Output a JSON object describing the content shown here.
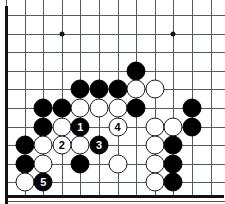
{
  "diagram": {
    "board": {
      "kind": "go-board",
      "visible_columns": 12,
      "visible_rows": 11,
      "cell_size": 18.6,
      "origin_x": 6,
      "origin_y": 15,
      "line_color": "#555a5e",
      "edge_color": "#101214",
      "background_color": "#ffffff",
      "black_color": "#000000",
      "white_color": "#ffffff",
      "edges": [
        "left",
        "bottom"
      ],
      "star_points": [
        {
          "col": 3,
          "row": 1
        },
        {
          "col": 9,
          "row": 1
        }
      ]
    },
    "stones": [
      {
        "col": 7,
        "row": 3,
        "color": "black",
        "label": ""
      },
      {
        "col": 4,
        "row": 4,
        "color": "black",
        "label": ""
      },
      {
        "col": 5,
        "row": 4,
        "color": "black",
        "label": ""
      },
      {
        "col": 6,
        "row": 4,
        "color": "black",
        "label": ""
      },
      {
        "col": 7,
        "row": 4,
        "color": "white",
        "label": ""
      },
      {
        "col": 8,
        "row": 4,
        "color": "white",
        "label": ""
      },
      {
        "col": 2,
        "row": 5,
        "color": "black",
        "label": ""
      },
      {
        "col": 3,
        "row": 5,
        "color": "black",
        "label": ""
      },
      {
        "col": 4,
        "row": 5,
        "color": "white",
        "label": ""
      },
      {
        "col": 5,
        "row": 5,
        "color": "white",
        "label": ""
      },
      {
        "col": 6,
        "row": 5,
        "color": "white",
        "label": ""
      },
      {
        "col": 7,
        "row": 5,
        "color": "black",
        "label": ""
      },
      {
        "col": 10,
        "row": 5,
        "color": "black",
        "label": ""
      },
      {
        "col": 2,
        "row": 6,
        "color": "black",
        "label": ""
      },
      {
        "col": 3,
        "row": 6,
        "color": "white",
        "label": ""
      },
      {
        "col": 4,
        "row": 6,
        "color": "black",
        "label": "1"
      },
      {
        "col": 6,
        "row": 6,
        "color": "white",
        "label": "4"
      },
      {
        "col": 8,
        "row": 6,
        "color": "white",
        "label": ""
      },
      {
        "col": 9,
        "row": 6,
        "color": "white",
        "label": ""
      },
      {
        "col": 10,
        "row": 6,
        "color": "black",
        "label": ""
      },
      {
        "col": 1,
        "row": 7,
        "color": "black",
        "label": ""
      },
      {
        "col": 2,
        "row": 7,
        "color": "white",
        "label": ""
      },
      {
        "col": 3,
        "row": 7,
        "color": "white",
        "label": "2"
      },
      {
        "col": 4,
        "row": 7,
        "color": "white",
        "label": ""
      },
      {
        "col": 5,
        "row": 7,
        "color": "black",
        "label": "3"
      },
      {
        "col": 8,
        "row": 7,
        "color": "white",
        "label": ""
      },
      {
        "col": 9,
        "row": 7,
        "color": "black",
        "label": ""
      },
      {
        "col": 1,
        "row": 8,
        "color": "black",
        "label": ""
      },
      {
        "col": 2,
        "row": 8,
        "color": "white",
        "label": ""
      },
      {
        "col": 4,
        "row": 8,
        "color": "black",
        "label": ""
      },
      {
        "col": 6,
        "row": 8,
        "color": "white",
        "label": ""
      },
      {
        "col": 8,
        "row": 8,
        "color": "white",
        "label": ""
      },
      {
        "col": 9,
        "row": 8,
        "color": "black",
        "label": ""
      },
      {
        "col": 1,
        "row": 9,
        "color": "white",
        "label": ""
      },
      {
        "col": 2,
        "row": 9,
        "color": "black",
        "label": "5"
      },
      {
        "col": 8,
        "row": 9,
        "color": "white",
        "label": ""
      },
      {
        "col": 9,
        "row": 9,
        "color": "black",
        "label": ""
      }
    ],
    "move_sequence": [
      {
        "number": "1",
        "color": "black"
      },
      {
        "number": "2",
        "color": "white"
      },
      {
        "number": "3",
        "color": "black"
      },
      {
        "number": "4",
        "color": "white"
      },
      {
        "number": "5",
        "color": "black"
      }
    ]
  }
}
